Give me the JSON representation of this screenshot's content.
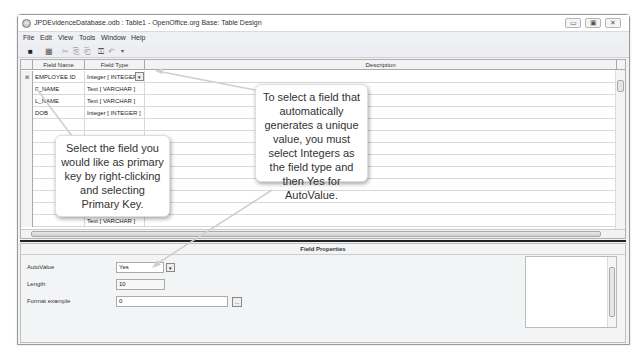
{
  "window": {
    "title": "JPDEvidenceDatabase.odb : Table1 - OpenOffice.org Base: Table Design",
    "controls": {
      "minimize": "▭",
      "maximize": "▣",
      "close": "✕"
    }
  },
  "menubar": {
    "items": [
      {
        "label": "File"
      },
      {
        "label": "Edit"
      },
      {
        "label": "View"
      },
      {
        "label": "Tools"
      },
      {
        "label": "Window"
      },
      {
        "label": "Help"
      }
    ]
  },
  "toolbar": {
    "buttons": [
      {
        "icon": "save-icon",
        "glyph": "■"
      },
      {
        "icon": "edit-icon",
        "glyph": "▦"
      },
      {
        "icon": "cut-icon",
        "glyph": "✂"
      },
      {
        "icon": "copy-icon",
        "glyph": "⎘"
      },
      {
        "icon": "paste-icon",
        "glyph": "⎗"
      },
      {
        "icon": "primary-key-icon",
        "glyph": "⚿"
      },
      {
        "icon": "undo-icon",
        "glyph": "↶"
      },
      {
        "icon": "more-icon",
        "glyph": "▾"
      }
    ]
  },
  "table": {
    "columns": {
      "field_name": "Field Name",
      "field_type": "Field Type",
      "description": "Description"
    },
    "rows": [
      {
        "marker": "⊠",
        "field_name": "EMPLOYEE ID",
        "field_type": "Integer [ INTEGER ]",
        "has_dropdown": true
      },
      {
        "marker": "",
        "field_name": "F_NAME",
        "field_type": "Text [ VARCHAR ]"
      },
      {
        "marker": "",
        "field_name": "L_NAME",
        "field_type": "Text [ VARCHAR ]"
      },
      {
        "marker": "",
        "field_name": "DOB",
        "field_type": "Integer [ INTEGER ]"
      },
      {
        "marker": "",
        "field_name": "",
        "field_type": ""
      },
      {
        "marker": "",
        "field_name": "",
        "field_type": ""
      },
      {
        "marker": "",
        "field_name": "",
        "field_type": ""
      },
      {
        "marker": "",
        "field_name": "",
        "field_type": ""
      },
      {
        "marker": "",
        "field_name": "",
        "field_type": ""
      },
      {
        "marker": "",
        "field_name": "",
        "field_type": ""
      },
      {
        "marker": "",
        "field_name": "",
        "field_type": ""
      },
      {
        "marker": "",
        "field_name": "",
        "field_type": ""
      },
      {
        "marker": "",
        "field_name": "",
        "field_type": "Text [ VARCHAR ]"
      }
    ],
    "dropdown_glyph": "▾"
  },
  "field_properties": {
    "title": "Field Properties",
    "autovalue": {
      "label": "AutoValue",
      "value": "Yes"
    },
    "length": {
      "label": "Length",
      "value": "10"
    },
    "format_example": {
      "label": "Format example",
      "value": "0",
      "button": "..."
    }
  },
  "callouts": {
    "autovalue_tip": "To select a field that automatically generates a unique value, you must select Integers as the field type and then Yes for AutoValue.",
    "primary_key_tip": "Select the field you would like as primary key by right-clicking and selecting Primary Key."
  }
}
